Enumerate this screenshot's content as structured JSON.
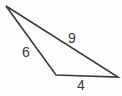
{
  "figure": {
    "kind": "geometry-diagram",
    "shape": "triangle",
    "background_color": "#fdfdfd",
    "stroke_color": "#3a3a3a",
    "label_color": "#3a3a3a",
    "stroke_width": 1.6,
    "width": 122,
    "height": 96,
    "vertices": [
      {
        "name": "apex",
        "x": 6,
        "y": 6
      },
      {
        "name": "bottom-left",
        "x": 56,
        "y": 75
      },
      {
        "name": "bottom-right",
        "x": 118,
        "y": 77
      }
    ],
    "sides": [
      {
        "name": "left-side",
        "label": "6",
        "from": "apex",
        "to": "bottom-left",
        "label_x": 26,
        "label_y": 52
      },
      {
        "name": "hypotenuse",
        "label": "9",
        "from": "apex",
        "to": "bottom-right",
        "label_x": 72,
        "label_y": 38
      },
      {
        "name": "base",
        "label": "4",
        "from": "bottom-left",
        "to": "bottom-right",
        "label_x": 81,
        "label_y": 85
      }
    ],
    "polygon_points": "6,6 56,75 118,77"
  }
}
